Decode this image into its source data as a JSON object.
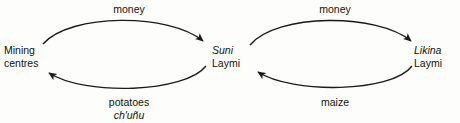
{
  "diagram": {
    "type": "cycle-exchange-diagram",
    "nodes": [
      {
        "id": "mining-centres",
        "line1": "Mining",
        "line2": "centres",
        "line1_style": "roman",
        "line2_style": "roman"
      },
      {
        "id": "suni-laymi",
        "line1": "Suni",
        "line2": "Laymi",
        "line1_style": "italic",
        "line2_style": "roman"
      },
      {
        "id": "likina-laymi",
        "line1": "Likina",
        "line2": "Laymi",
        "line1_style": "italic",
        "line2_style": "roman"
      }
    ],
    "edges": [
      {
        "id": "mining-to-suni",
        "from": "mining-centres",
        "to": "suni-laymi",
        "position": "top-left",
        "line1": "money",
        "line2": "",
        "line1_style": "roman",
        "line2_style": "roman"
      },
      {
        "id": "suni-to-mining",
        "from": "suni-laymi",
        "to": "mining-centres",
        "position": "bottom-left",
        "line1": "potatoes",
        "line2": "ch'uñu",
        "line1_style": "roman",
        "line2_style": "italic"
      },
      {
        "id": "suni-to-likina",
        "from": "suni-laymi",
        "to": "likina-laymi",
        "position": "top-right",
        "line1": "money",
        "line2": "",
        "line1_style": "roman",
        "line2_style": "roman"
      },
      {
        "id": "likina-to-suni",
        "from": "likina-laymi",
        "to": "suni-laymi",
        "position": "bottom-right",
        "line1": "maize",
        "line2": "",
        "line1_style": "roman",
        "line2_style": "roman"
      }
    ],
    "colors": {
      "background": "#fdfdfc",
      "ink": "#111111",
      "stroke": "#1a1a1a"
    }
  }
}
